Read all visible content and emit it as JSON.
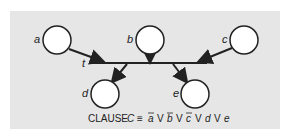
{
  "diagram": {
    "nodes": [
      {
        "id": "a",
        "label": "a",
        "cx": 57,
        "cy": 40,
        "r": 14
      },
      {
        "id": "b",
        "label": "b",
        "cx": 150,
        "cy": 40,
        "r": 14
      },
      {
        "id": "c",
        "label": "c",
        "cx": 244,
        "cy": 40,
        "r": 14
      },
      {
        "id": "d",
        "label": "d",
        "cx": 105,
        "cy": 94,
        "r": 14
      },
      {
        "id": "e",
        "label": "e",
        "cx": 195,
        "cy": 94,
        "r": 14
      }
    ],
    "bar_label": "t",
    "caption": {
      "prefix": "CLAUSE",
      "var": "C",
      "equiv": "≡",
      "terms": [
        "a",
        "V",
        "b",
        "V",
        "c",
        "V",
        "d",
        "V",
        "e"
      ],
      "negated": [
        "a",
        "b",
        "c"
      ]
    },
    "colors": {
      "panel": "#e6e6e6",
      "stroke": "#222222",
      "node_fill": "#ffffff"
    }
  }
}
